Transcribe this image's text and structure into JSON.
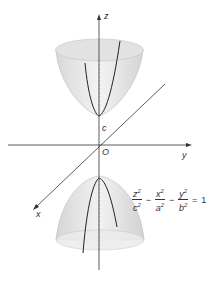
{
  "figure": {
    "axes": {
      "z_label": "z",
      "y_label": "y",
      "x_label": "x",
      "origin_label": "O",
      "vertex_label": "c"
    },
    "equation": {
      "terms": [
        {
          "num_var": "z",
          "den_var": "c",
          "power": "2"
        },
        {
          "num_var": "x",
          "den_var": "a",
          "power": "2"
        },
        {
          "num_var": "y",
          "den_var": "b",
          "power": "2"
        }
      ],
      "operators": [
        "−",
        "−"
      ],
      "equals": "=",
      "rhs": "1"
    },
    "colors": {
      "surface": "#e6e6e6",
      "line": "#333333",
      "curve": "#222222"
    }
  }
}
